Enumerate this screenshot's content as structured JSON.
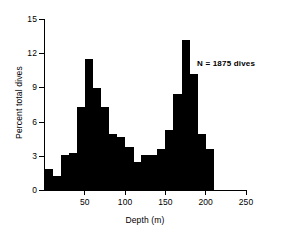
{
  "chart_data": {
    "type": "bar",
    "title": "",
    "subtitle": "",
    "xlabel": "Depth (m)",
    "ylabel": "Percent total dives",
    "xlim": [
      0,
      250
    ],
    "ylim": [
      0,
      15
    ],
    "xticks": [
      50,
      100,
      150,
      200,
      250
    ],
    "yticks": [
      0,
      3,
      6,
      9,
      12,
      15
    ],
    "xtick_labels": [
      "50",
      "100",
      "150",
      "200",
      "250"
    ],
    "ytick_labels": [
      "0",
      "3",
      "6",
      "9",
      "12",
      "15"
    ],
    "grid": false,
    "legend": null,
    "bin_width": 10,
    "bin_starts": [
      0,
      10,
      20,
      30,
      40,
      50,
      60,
      70,
      80,
      90,
      100,
      110,
      120,
      130,
      140,
      150,
      160,
      170,
      180,
      190,
      200
    ],
    "categories": [
      "0-10",
      "10-20",
      "20-30",
      "30-40",
      "40-50",
      "50-60",
      "60-70",
      "70-80",
      "80-90",
      "90-100",
      "100-110",
      "110-120",
      "120-130",
      "130-140",
      "140-150",
      "150-160",
      "160-170",
      "170-180",
      "180-190",
      "190-200",
      "200-210"
    ],
    "values": [
      1.9,
      1.3,
      3.1,
      3.3,
      7.3,
      11.5,
      9.0,
      7.3,
      5.0,
      4.7,
      3.8,
      2.5,
      3.1,
      3.1,
      3.6,
      5.3,
      8.5,
      13.2,
      10.2,
      5.0,
      3.6
    ],
    "bar_color": "#000000",
    "annotations": [
      {
        "text": "N = 1875 dives",
        "x": 200,
        "y": 11.5
      }
    ]
  },
  "annotation_text": "N = 1875 dives"
}
